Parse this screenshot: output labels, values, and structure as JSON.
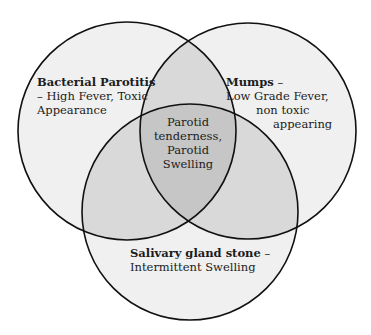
{
  "diagram": {
    "type": "venn-3",
    "colors": {
      "background": "#ffffff",
      "circle_fill": "#f0f0f0",
      "pair_overlap_fill": "#d9d9d9",
      "triple_overlap_fill": "#c6c6c6",
      "stroke": "#111111"
    },
    "circles": [
      {
        "id": "left",
        "cx": 127,
        "cy": 131,
        "r": 109
      },
      {
        "id": "right",
        "cx": 248,
        "cy": 131,
        "r": 108
      },
      {
        "id": "bottom",
        "cx": 190,
        "cy": 212,
        "r": 108
      }
    ],
    "sets": {
      "left": {
        "title": "Bacterial Parotitis",
        "line1": "– High Fever, Toxic",
        "line2": "Appearance"
      },
      "right": {
        "title": "Mumps",
        "title_suffix": " –",
        "line1": "Low Grade Fever,",
        "line2": "non toxic",
        "line3": "appearing"
      },
      "bottom": {
        "title": "Salivary gland stone",
        "title_suffix": " –",
        "line1": "Intermittent Swelling"
      },
      "center": {
        "line1": "Parotid",
        "line2": "tenderness,",
        "line3": "Parotid",
        "line4": "Swelling"
      }
    }
  }
}
